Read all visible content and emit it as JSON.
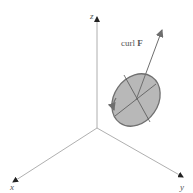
{
  "diagram": {
    "type": "3d-coordinate-axes",
    "axes": {
      "x": {
        "label": "x"
      },
      "y": {
        "label": "y"
      },
      "z": {
        "label": "z"
      }
    },
    "vector": {
      "label_prefix": "curl ",
      "label_bold": "F"
    },
    "disc": {
      "description": "rotating disc with curl vector normal"
    },
    "colors": {
      "axis": "#7a7a7a",
      "disc_fill": "#b8b8b8",
      "disc_stroke": "#6e6e6e",
      "vector": "#6e6e6e",
      "label": "#555555"
    }
  }
}
